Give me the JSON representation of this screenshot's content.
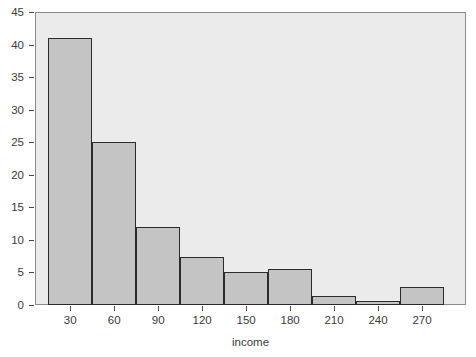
{
  "chart_data": {
    "type": "bar",
    "title": "",
    "xlabel": "income",
    "ylabel": "",
    "grid": false,
    "legend": false,
    "bin_width": 30,
    "bin_edges": [
      15,
      45,
      75,
      105,
      135,
      165,
      195,
      225,
      255,
      285
    ],
    "categories": [
      "15-45",
      "45-75",
      "75-105",
      "105-135",
      "135-165",
      "165-195",
      "195-225",
      "225-255",
      "255-285"
    ],
    "values": [
      41,
      25,
      12,
      7.3,
      5,
      5.5,
      1.4,
      0.6,
      2.8
    ],
    "xlim": [
      6,
      300
    ],
    "ylim": [
      0,
      45
    ],
    "xticks": [
      30,
      60,
      90,
      120,
      150,
      180,
      210,
      240,
      270
    ],
    "xtick_labels": [
      "30",
      "60",
      "90",
      "120",
      "150",
      "180",
      "210",
      "240",
      "270"
    ],
    "yticks": [
      0,
      5,
      10,
      15,
      20,
      25,
      30,
      35,
      40,
      45
    ],
    "ytick_labels": [
      "0",
      "5",
      "10",
      "15",
      "20",
      "25",
      "30",
      "35",
      "40",
      "45"
    ],
    "colors": {
      "bar_fill": "#c4c4c4",
      "bar_edge": "#2b2b2b",
      "plot_background": "#ebebeb",
      "frame": "#8c8c8c",
      "text": "#3a3a3a"
    }
  }
}
